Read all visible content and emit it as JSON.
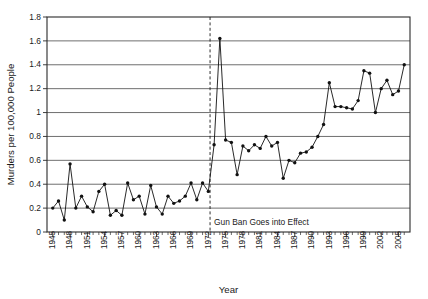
{
  "chart_data": {
    "type": "line",
    "title": "",
    "xlabel": "Year",
    "ylabel": "Murders per 100,000 People",
    "xlim": [
      1944,
      2007
    ],
    "ylim": [
      0,
      1.8
    ],
    "grid": true,
    "legend_position": "none",
    "ytick_labels": [
      "0",
      "0.2",
      "0.4",
      "0.6",
      "0.8",
      "1",
      "1.2",
      "1.4",
      "1.6",
      "1.8"
    ],
    "ytick_values": [
      0,
      0.2,
      0.4,
      0.6,
      0.8,
      1,
      1.2,
      1.4,
      1.6,
      1.8
    ],
    "xtick_labels": [
      "1945",
      "1948",
      "1951",
      "1954",
      "1957",
      "1960",
      "1963",
      "1966",
      "1969",
      "1972",
      "1975",
      "1978",
      "1981",
      "1984",
      "1987",
      "1990",
      "1993",
      "1996",
      "1999",
      "2002",
      "2005"
    ],
    "xtick_values": [
      1945,
      1948,
      1951,
      1954,
      1957,
      1960,
      1963,
      1966,
      1969,
      1972,
      1975,
      1978,
      1981,
      1984,
      1987,
      1990,
      1993,
      1996,
      1999,
      2002,
      2005
    ],
    "annotations": [
      {
        "name": "gun-ban-marker",
        "label": "Gun Ban Goes into Effect",
        "x": 1972.3,
        "style": "vertical-dashed-line"
      }
    ],
    "series": [
      {
        "name": "Murder rate",
        "color": "#111111",
        "x": [
          1945,
          1946,
          1947,
          1948,
          1949,
          1950,
          1951,
          1952,
          1953,
          1954,
          1955,
          1956,
          1957,
          1958,
          1959,
          1960,
          1961,
          1962,
          1963,
          1964,
          1965,
          1966,
          1967,
          1968,
          1969,
          1970,
          1971,
          1972,
          1973,
          1974,
          1975,
          1976,
          1977,
          1978,
          1979,
          1980,
          1981,
          1982,
          1983,
          1984,
          1985,
          1986,
          1987,
          1988,
          1989,
          1990,
          1991,
          1992,
          1993,
          1994,
          1995,
          1996,
          1997,
          1998,
          1999,
          2000,
          2001,
          2002,
          2003,
          2004,
          2005,
          2006
        ],
        "values": [
          0.2,
          0.26,
          0.1,
          0.57,
          0.2,
          0.3,
          0.21,
          0.17,
          0.34,
          0.4,
          0.14,
          0.18,
          0.14,
          0.41,
          0.27,
          0.3,
          0.15,
          0.39,
          0.21,
          0.15,
          0.3,
          0.24,
          0.26,
          0.3,
          0.41,
          0.27,
          0.41,
          0.34,
          0.73,
          1.62,
          0.77,
          0.75,
          0.48,
          0.72,
          0.68,
          0.73,
          0.7,
          0.8,
          0.72,
          0.75,
          0.45,
          0.6,
          0.58,
          0.66,
          0.67,
          0.71,
          0.8,
          0.9,
          1.25,
          1.05,
          1.05,
          1.04,
          1.03,
          1.1,
          1.35,
          1.33,
          1.0,
          1.2,
          1.27,
          1.15,
          1.18,
          1.4
        ]
      }
    ]
  },
  "axes": {
    "x_title": "Year",
    "y_title": "Murders per 100,000 People"
  }
}
